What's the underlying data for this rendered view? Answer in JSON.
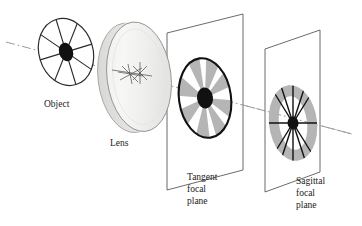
{
  "figure": {
    "type": "optics-ray-diagram",
    "background_color": "#ffffff",
    "ink_color": "#1a1a1a",
    "gray_fill_color": "#b3b3b3",
    "lens_fill_color": "#f2f2f0",
    "axis_color": "#999999"
  },
  "labels": {
    "object": "Object",
    "lens": "Lens",
    "tangent_line1": "Tangent",
    "tangent_line2": "focal",
    "tangent_line3": "plane",
    "sagittal_line1": "Sagittal",
    "sagittal_line2": "focal",
    "sagittal_line3": "plane"
  },
  "elements": {
    "optical_axis": {
      "name": "optical-axis",
      "style": "dash-dot",
      "start": [
        6,
        42
      ],
      "end": [
        352,
        134
      ]
    },
    "object_wheel": {
      "name": "object-spoke-wheel",
      "center": [
        66,
        52
      ],
      "rx": 27,
      "ry": 34,
      "rotation_deg": -17,
      "spoke_count": 8,
      "hub_rx": 7,
      "hub_ry": 9
    },
    "lens": {
      "name": "lens-disc",
      "center": [
        137,
        77
      ],
      "rx": 32,
      "ry": 55,
      "rotation_deg": -7,
      "edge_thickness": 9
    },
    "tangent_plane": {
      "name": "tangent-focal-plane",
      "corners": [
        [
          167,
          33
        ],
        [
          243,
          14
        ],
        [
          243,
          170
        ],
        [
          167,
          190
        ]
      ],
      "blur_patch": {
        "center": [
          205,
          98
        ],
        "rx": 26,
        "ry": 40,
        "rotation_deg": -8,
        "wedge_count": 8,
        "hub_rx": 8,
        "hub_ry": 10
      }
    },
    "sagittal_plane": {
      "name": "sagittal-focal-plane",
      "corners": [
        [
          265,
          49
        ],
        [
          320,
          30
        ],
        [
          320,
          172
        ],
        [
          265,
          192
        ]
      ],
      "blur_patch": {
        "center": [
          293,
          123
        ],
        "rx": 24,
        "ry": 38,
        "rotation_deg": -7,
        "ring_thickness": 11,
        "spoke_count": 8,
        "hub_rx": 5,
        "hub_ry": 6
      }
    },
    "lens_rays": {
      "name": "lens-ray-crossing-marks",
      "center": [
        130,
        73
      ]
    }
  },
  "label_positions": {
    "object": [
      44,
      104
    ],
    "lens": [
      110,
      143
    ],
    "tangent": [
      187,
      178
    ],
    "sagittal": [
      296,
      182
    ]
  }
}
